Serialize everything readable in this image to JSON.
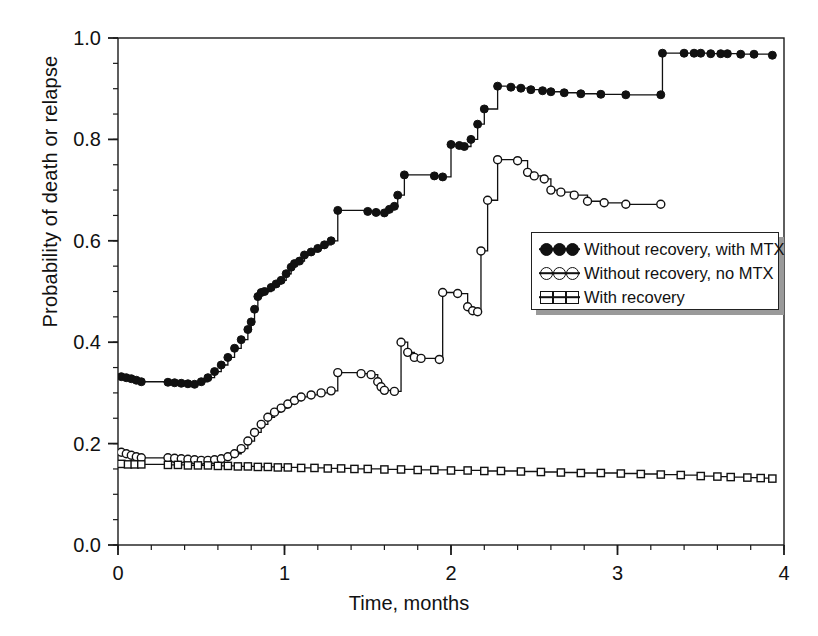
{
  "chart_data": {
    "type": "line",
    "title": "",
    "xlabel": "Time, months",
    "ylabel": "Probability of death or relapse",
    "xlim": [
      0,
      4
    ],
    "ylim": [
      0,
      1.0
    ],
    "xticks": [
      "0",
      "1",
      "2",
      "3",
      "4"
    ],
    "xtick_values": [
      0,
      1,
      2,
      3,
      4
    ],
    "yticks": [
      "0.0",
      "0.2",
      "0.4",
      "0.6",
      "0.8",
      "1.0"
    ],
    "ytick_values": [
      0.0,
      0.2,
      0.4,
      0.6,
      0.8,
      1.0
    ],
    "minor_tick_step_x": 0.2,
    "minor_tick_step_y": 0.05,
    "grid": false,
    "legend_position": "center-right",
    "interpolation": "step-post",
    "series": [
      {
        "name": "Without recovery, with MTX",
        "marker": "filled-circle",
        "points": [
          [
            0.02,
            0.332
          ],
          [
            0.05,
            0.33
          ],
          [
            0.08,
            0.328
          ],
          [
            0.11,
            0.325
          ],
          [
            0.14,
            0.322
          ],
          [
            0.3,
            0.321
          ],
          [
            0.34,
            0.32
          ],
          [
            0.38,
            0.319
          ],
          [
            0.42,
            0.318
          ],
          [
            0.46,
            0.317
          ],
          [
            0.5,
            0.322
          ],
          [
            0.54,
            0.33
          ],
          [
            0.58,
            0.342
          ],
          [
            0.62,
            0.355
          ],
          [
            0.66,
            0.37
          ],
          [
            0.7,
            0.388
          ],
          [
            0.74,
            0.405
          ],
          [
            0.78,
            0.425
          ],
          [
            0.8,
            0.44
          ],
          [
            0.82,
            0.465
          ],
          [
            0.84,
            0.49
          ],
          [
            0.86,
            0.498
          ],
          [
            0.88,
            0.5
          ],
          [
            0.92,
            0.508
          ],
          [
            0.95,
            0.515
          ],
          [
            0.98,
            0.522
          ],
          [
            1.01,
            0.535
          ],
          [
            1.04,
            0.548
          ],
          [
            1.06,
            0.555
          ],
          [
            1.09,
            0.56
          ],
          [
            1.12,
            0.572
          ],
          [
            1.16,
            0.578
          ],
          [
            1.2,
            0.585
          ],
          [
            1.24,
            0.592
          ],
          [
            1.28,
            0.6
          ],
          [
            1.32,
            0.66
          ],
          [
            1.5,
            0.658
          ],
          [
            1.55,
            0.656
          ],
          [
            1.6,
            0.655
          ],
          [
            1.63,
            0.662
          ],
          [
            1.66,
            0.668
          ],
          [
            1.68,
            0.69
          ],
          [
            1.72,
            0.73
          ],
          [
            1.9,
            0.728
          ],
          [
            1.95,
            0.726
          ],
          [
            2.0,
            0.79
          ],
          [
            2.05,
            0.788
          ],
          [
            2.08,
            0.786
          ],
          [
            2.12,
            0.8
          ],
          [
            2.16,
            0.83
          ],
          [
            2.2,
            0.86
          ],
          [
            2.28,
            0.905
          ],
          [
            2.36,
            0.903
          ],
          [
            2.42,
            0.901
          ],
          [
            2.48,
            0.898
          ],
          [
            2.55,
            0.896
          ],
          [
            2.6,
            0.894
          ],
          [
            2.68,
            0.892
          ],
          [
            2.78,
            0.89
          ],
          [
            2.9,
            0.889
          ],
          [
            3.05,
            0.888
          ],
          [
            3.26,
            0.888
          ],
          [
            3.27,
            0.97
          ],
          [
            3.4,
            0.97
          ],
          [
            3.46,
            0.97
          ],
          [
            3.5,
            0.97
          ],
          [
            3.56,
            0.969
          ],
          [
            3.62,
            0.969
          ],
          [
            3.66,
            0.969
          ],
          [
            3.74,
            0.968
          ],
          [
            3.82,
            0.968
          ],
          [
            3.93,
            0.966
          ]
        ]
      },
      {
        "name": "Without recovery, no MTX",
        "marker": "open-circle",
        "points": [
          [
            0.02,
            0.183
          ],
          [
            0.05,
            0.18
          ],
          [
            0.08,
            0.177
          ],
          [
            0.11,
            0.174
          ],
          [
            0.14,
            0.172
          ],
          [
            0.3,
            0.172
          ],
          [
            0.34,
            0.171
          ],
          [
            0.38,
            0.17
          ],
          [
            0.42,
            0.169
          ],
          [
            0.46,
            0.168
          ],
          [
            0.5,
            0.167
          ],
          [
            0.54,
            0.167
          ],
          [
            0.58,
            0.168
          ],
          [
            0.62,
            0.17
          ],
          [
            0.66,
            0.174
          ],
          [
            0.7,
            0.18
          ],
          [
            0.74,
            0.19
          ],
          [
            0.78,
            0.205
          ],
          [
            0.82,
            0.222
          ],
          [
            0.86,
            0.238
          ],
          [
            0.9,
            0.252
          ],
          [
            0.94,
            0.262
          ],
          [
            0.98,
            0.27
          ],
          [
            1.02,
            0.278
          ],
          [
            1.06,
            0.285
          ],
          [
            1.1,
            0.292
          ],
          [
            1.16,
            0.296
          ],
          [
            1.22,
            0.3
          ],
          [
            1.28,
            0.304
          ],
          [
            1.32,
            0.34
          ],
          [
            1.46,
            0.338
          ],
          [
            1.52,
            0.336
          ],
          [
            1.56,
            0.322
          ],
          [
            1.58,
            0.312
          ],
          [
            1.6,
            0.305
          ],
          [
            1.66,
            0.303
          ],
          [
            1.7,
            0.4
          ],
          [
            1.74,
            0.38
          ],
          [
            1.78,
            0.37
          ],
          [
            1.82,
            0.368
          ],
          [
            1.93,
            0.366
          ],
          [
            1.95,
            0.498
          ],
          [
            2.04,
            0.496
          ],
          [
            2.1,
            0.47
          ],
          [
            2.13,
            0.462
          ],
          [
            2.16,
            0.46
          ],
          [
            2.18,
            0.58
          ],
          [
            2.22,
            0.68
          ],
          [
            2.28,
            0.76
          ],
          [
            2.4,
            0.758
          ],
          [
            2.46,
            0.735
          ],
          [
            2.5,
            0.728
          ],
          [
            2.56,
            0.722
          ],
          [
            2.6,
            0.7
          ],
          [
            2.66,
            0.696
          ],
          [
            2.74,
            0.69
          ],
          [
            2.82,
            0.678
          ],
          [
            2.92,
            0.675
          ],
          [
            3.05,
            0.672
          ],
          [
            3.26,
            0.672
          ]
        ]
      },
      {
        "name": "With recovery",
        "marker": "open-square",
        "points": [
          [
            0.02,
            0.16
          ],
          [
            0.06,
            0.159
          ],
          [
            0.1,
            0.159
          ],
          [
            0.14,
            0.159
          ],
          [
            0.3,
            0.158
          ],
          [
            0.36,
            0.158
          ],
          [
            0.42,
            0.157
          ],
          [
            0.48,
            0.157
          ],
          [
            0.54,
            0.157
          ],
          [
            0.6,
            0.156
          ],
          [
            0.66,
            0.156
          ],
          [
            0.72,
            0.155
          ],
          [
            0.78,
            0.155
          ],
          [
            0.84,
            0.154
          ],
          [
            0.9,
            0.154
          ],
          [
            0.96,
            0.153
          ],
          [
            1.02,
            0.153
          ],
          [
            1.1,
            0.152
          ],
          [
            1.18,
            0.152
          ],
          [
            1.26,
            0.151
          ],
          [
            1.34,
            0.151
          ],
          [
            1.42,
            0.15
          ],
          [
            1.5,
            0.15
          ],
          [
            1.6,
            0.149
          ],
          [
            1.7,
            0.149
          ],
          [
            1.8,
            0.148
          ],
          [
            1.9,
            0.148
          ],
          [
            2.0,
            0.147
          ],
          [
            2.1,
            0.147
          ],
          [
            2.2,
            0.146
          ],
          [
            2.3,
            0.146
          ],
          [
            2.42,
            0.145
          ],
          [
            2.54,
            0.144
          ],
          [
            2.66,
            0.143
          ],
          [
            2.78,
            0.142
          ],
          [
            2.9,
            0.142
          ],
          [
            3.02,
            0.141
          ],
          [
            3.14,
            0.14
          ],
          [
            3.26,
            0.139
          ],
          [
            3.38,
            0.138
          ],
          [
            3.5,
            0.136
          ],
          [
            3.6,
            0.135
          ],
          [
            3.68,
            0.134
          ],
          [
            3.78,
            0.133
          ],
          [
            3.86,
            0.132
          ],
          [
            3.93,
            0.131
          ]
        ]
      }
    ],
    "legend": [
      {
        "label": "Without recovery, with MTX",
        "marker": "filled-circle"
      },
      {
        "label": "Without recovery, no MTX",
        "marker": "open-circle"
      },
      {
        "label": "With recovery",
        "marker": "open-square"
      }
    ]
  },
  "colors": {
    "axis": "#1a1a1a",
    "series": "#111111",
    "background": "#ffffff",
    "legend_shadow": "#9a9a9a"
  }
}
